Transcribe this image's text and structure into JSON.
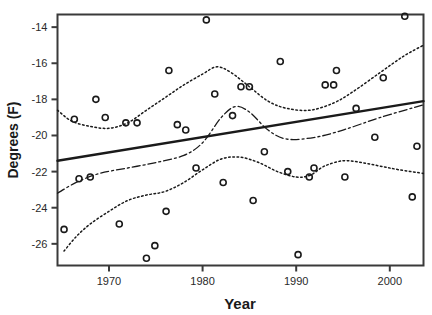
{
  "chart_data": {
    "type": "scatter",
    "title": "",
    "xlabel": "Year",
    "ylabel": "Degrees (F)",
    "xlim": [
      1964.5,
      2003.6
    ],
    "ylim": [
      -27.2,
      -13.3
    ],
    "xticks": [
      1970,
      1980,
      1990,
      2000
    ],
    "xticklabels": [
      "1970",
      "1980",
      "1990",
      "2000"
    ],
    "yticks": [
      -14,
      -16,
      -18,
      -20,
      -22,
      -24,
      -26
    ],
    "yticklabels": [
      "-14",
      "-16",
      "-18",
      "-20",
      "-22",
      "-24",
      "-26"
    ],
    "grid": false,
    "legend": "none",
    "marker": "open-circle",
    "points": [
      {
        "x": 1965.2,
        "y": -25.2
      },
      {
        "x": 1966.3,
        "y": -19.1
      },
      {
        "x": 1966.8,
        "y": -22.4
      },
      {
        "x": 1968.0,
        "y": -22.3
      },
      {
        "x": 1968.6,
        "y": -18.0
      },
      {
        "x": 1969.6,
        "y": -19.0
      },
      {
        "x": 1971.1,
        "y": -24.9
      },
      {
        "x": 1971.8,
        "y": -19.3
      },
      {
        "x": 1973.0,
        "y": -19.3
      },
      {
        "x": 1974.0,
        "y": -26.8
      },
      {
        "x": 1974.9,
        "y": -26.1
      },
      {
        "x": 1976.1,
        "y": -24.2
      },
      {
        "x": 1976.4,
        "y": -16.4
      },
      {
        "x": 1977.3,
        "y": -19.4
      },
      {
        "x": 1978.2,
        "y": -19.7
      },
      {
        "x": 1979.3,
        "y": -21.8
      },
      {
        "x": 1980.4,
        "y": -13.6
      },
      {
        "x": 1981.3,
        "y": -17.7
      },
      {
        "x": 1982.2,
        "y": -22.6
      },
      {
        "x": 1983.2,
        "y": -18.9
      },
      {
        "x": 1984.1,
        "y": -17.3
      },
      {
        "x": 1985.0,
        "y": -17.3
      },
      {
        "x": 1985.4,
        "y": -23.6
      },
      {
        "x": 1986.6,
        "y": -20.9
      },
      {
        "x": 1988.3,
        "y": -15.9
      },
      {
        "x": 1989.1,
        "y": -22.0
      },
      {
        "x": 1990.2,
        "y": -26.6
      },
      {
        "x": 1991.4,
        "y": -22.3
      },
      {
        "x": 1991.9,
        "y": -21.8
      },
      {
        "x": 1993.1,
        "y": -17.2
      },
      {
        "x": 1994.0,
        "y": -17.2
      },
      {
        "x": 1994.3,
        "y": -16.4
      },
      {
        "x": 1995.2,
        "y": -22.3
      },
      {
        "x": 1996.4,
        "y": -18.5
      },
      {
        "x": 1998.4,
        "y": -20.1
      },
      {
        "x": 1999.3,
        "y": -16.8
      },
      {
        "x": 2001.6,
        "y": -13.4
      },
      {
        "x": 2002.4,
        "y": -23.4
      },
      {
        "x": 2002.9,
        "y": -20.6
      }
    ],
    "series": [
      {
        "name": "linear-trend",
        "style": "solid",
        "points": [
          {
            "x": 1964.5,
            "y": -21.4
          },
          {
            "x": 2003.6,
            "y": -18.1
          }
        ]
      },
      {
        "name": "smoothed-mean",
        "style": "dash-dot",
        "points": [
          {
            "x": 1964.5,
            "y": -23.2
          },
          {
            "x": 1966.5,
            "y": -22.6
          },
          {
            "x": 1969.0,
            "y": -22.1
          },
          {
            "x": 1972.0,
            "y": -21.8
          },
          {
            "x": 1975.0,
            "y": -21.5
          },
          {
            "x": 1978.0,
            "y": -21.1
          },
          {
            "x": 1980.0,
            "y": -20.4
          },
          {
            "x": 1982.0,
            "y": -19.0
          },
          {
            "x": 1983.5,
            "y": -18.4
          },
          {
            "x": 1985.0,
            "y": -18.7
          },
          {
            "x": 1987.0,
            "y": -19.7
          },
          {
            "x": 1989.0,
            "y": -20.2
          },
          {
            "x": 1992.0,
            "y": -20.1
          },
          {
            "x": 1995.0,
            "y": -19.7
          },
          {
            "x": 1999.0,
            "y": -19.0
          },
          {
            "x": 2003.6,
            "y": -18.3
          }
        ]
      },
      {
        "name": "upper-confidence-band",
        "style": "dotted",
        "points": [
          {
            "x": 1964.5,
            "y": -18.6
          },
          {
            "x": 1966.0,
            "y": -19.2
          },
          {
            "x": 1968.0,
            "y": -19.5
          },
          {
            "x": 1970.0,
            "y": -19.6
          },
          {
            "x": 1972.0,
            "y": -19.3
          },
          {
            "x": 1974.0,
            "y": -18.6
          },
          {
            "x": 1976.0,
            "y": -17.9
          },
          {
            "x": 1978.0,
            "y": -17.2
          },
          {
            "x": 1980.0,
            "y": -16.6
          },
          {
            "x": 1981.5,
            "y": -16.2
          },
          {
            "x": 1983.0,
            "y": -16.5
          },
          {
            "x": 1985.0,
            "y": -17.3
          },
          {
            "x": 1987.0,
            "y": -18.1
          },
          {
            "x": 1989.0,
            "y": -18.5
          },
          {
            "x": 1991.5,
            "y": -18.6
          },
          {
            "x": 1994.0,
            "y": -18.2
          },
          {
            "x": 1996.0,
            "y": -17.6
          },
          {
            "x": 1999.0,
            "y": -16.5
          },
          {
            "x": 2001.5,
            "y": -15.6
          },
          {
            "x": 2003.6,
            "y": -15.0
          }
        ]
      },
      {
        "name": "lower-confidence-band",
        "style": "dotted",
        "points": [
          {
            "x": 1965.2,
            "y": -26.4
          },
          {
            "x": 1966.5,
            "y": -25.6
          },
          {
            "x": 1968.0,
            "y": -24.9
          },
          {
            "x": 1970.0,
            "y": -24.2
          },
          {
            "x": 1972.0,
            "y": -23.6
          },
          {
            "x": 1974.0,
            "y": -23.3
          },
          {
            "x": 1976.0,
            "y": -23.1
          },
          {
            "x": 1978.0,
            "y": -22.6
          },
          {
            "x": 1980.0,
            "y": -21.9
          },
          {
            "x": 1982.0,
            "y": -21.3
          },
          {
            "x": 1984.0,
            "y": -21.2
          },
          {
            "x": 1986.0,
            "y": -21.5
          },
          {
            "x": 1988.0,
            "y": -22.0
          },
          {
            "x": 1990.0,
            "y": -22.3
          },
          {
            "x": 1991.5,
            "y": -22.2
          },
          {
            "x": 1993.0,
            "y": -21.7
          },
          {
            "x": 1995.0,
            "y": -21.4
          },
          {
            "x": 1997.0,
            "y": -21.5
          },
          {
            "x": 1999.0,
            "y": -21.7
          },
          {
            "x": 2001.0,
            "y": -21.9
          },
          {
            "x": 2003.6,
            "y": -22.1
          }
        ]
      }
    ]
  },
  "axes": {
    "x_title": "Year",
    "y_title": "Degrees (F)"
  },
  "colors": {
    "axis": "#3a3a3a",
    "data": "#1a1a1a",
    "text": "#1a1a1a"
  }
}
